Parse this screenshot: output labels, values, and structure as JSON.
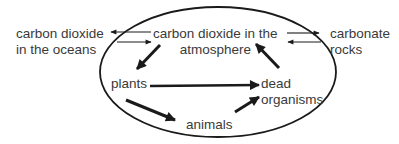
{
  "diagram": {
    "type": "carbon-cycle",
    "nodes": {
      "oceans": {
        "lines": [
          "carbon dioxide",
          "in the oceans"
        ]
      },
      "atmosphere": {
        "lines": [
          "carbon dioxide in the",
          "atmosphere"
        ]
      },
      "rocks": {
        "lines": [
          "carbonate",
          "rocks"
        ]
      },
      "plants": {
        "lines": [
          "plants"
        ]
      },
      "dead": {
        "lines": [
          "dead",
          "organisms"
        ]
      },
      "animals": {
        "lines": [
          "animals"
        ]
      }
    },
    "edges": [
      {
        "from": "atmosphere",
        "to": "oceans",
        "style": "thin"
      },
      {
        "from": "oceans",
        "to": "atmosphere",
        "style": "thin"
      },
      {
        "from": "atmosphere",
        "to": "rocks",
        "style": "thin"
      },
      {
        "from": "rocks",
        "to": "atmosphere",
        "style": "thin"
      },
      {
        "from": "atmosphere",
        "to": "plants",
        "style": "thick"
      },
      {
        "from": "plants",
        "to": "dead",
        "style": "thick"
      },
      {
        "from": "plants",
        "to": "animals",
        "style": "thick"
      },
      {
        "from": "animals",
        "to": "dead",
        "style": "thick"
      },
      {
        "from": "dead",
        "to": "atmosphere",
        "style": "thick"
      }
    ],
    "colors": {
      "stroke": "#1a1a1a",
      "text": "#3a3a3a",
      "background": "#ffffff"
    }
  }
}
